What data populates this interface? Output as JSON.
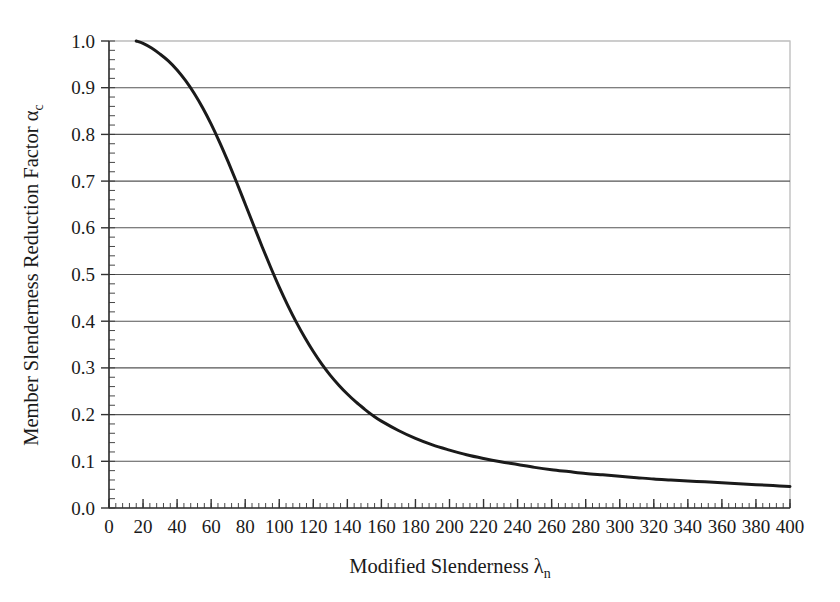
{
  "figure": {
    "background_color": "#ffffff",
    "plot_border_color": "#b4b4b4",
    "gridline_color": "#555555",
    "curve_color": "#1a1a1a",
    "axis_color": "#333333"
  },
  "axis_titles": {
    "x_main": "Modified Slenderness ",
    "x_symbol": "λ",
    "x_subscript": "n",
    "y_main": "Member Slenderness Reduction Factor ",
    "y_symbol": "α",
    "y_subscript": "c"
  },
  "chart_data": {
    "type": "line",
    "title": "",
    "subtitle": "",
    "xlabel": "Modified Slenderness λ_n",
    "ylabel": "Member Slenderness Reduction Factor α_c",
    "xlim": [
      0,
      400
    ],
    "ylim": [
      0.0,
      1.0
    ],
    "grid": true,
    "grid_axis": "y",
    "legend": "none",
    "xticks": [
      0,
      20,
      40,
      60,
      80,
      100,
      120,
      140,
      160,
      180,
      200,
      220,
      240,
      260,
      280,
      300,
      320,
      340,
      360,
      380,
      400
    ],
    "xtick_labels": [
      "0",
      "20",
      "40",
      "60",
      "80",
      "100",
      "120",
      "140",
      "160",
      "180",
      "200",
      "220",
      "240",
      "260",
      "280",
      "300",
      "320",
      "340",
      "360",
      "380",
      "400"
    ],
    "x_minor_tick_step": 4,
    "yticks": [
      0.0,
      0.1,
      0.2,
      0.3,
      0.4,
      0.5,
      0.6,
      0.7,
      0.8,
      0.9,
      1.0
    ],
    "ytick_labels": [
      "0.0",
      "0.1",
      "0.2",
      "0.3",
      "0.4",
      "0.5",
      "0.6",
      "0.7",
      "0.8",
      "0.9",
      "1.0"
    ],
    "y_minor_tick_step": 0.02,
    "series": [
      {
        "name": "Member slenderness reduction factor",
        "color": "#1a1a1a",
        "line_width": 3,
        "x": [
          16,
          20,
          25,
          30,
          35,
          40,
          45,
          50,
          55,
          60,
          65,
          70,
          75,
          80,
          85,
          90,
          95,
          100,
          105,
          110,
          115,
          120,
          125,
          130,
          135,
          140,
          145,
          150,
          155,
          160,
          170,
          180,
          190,
          200,
          210,
          220,
          230,
          240,
          250,
          260,
          270,
          280,
          290,
          300,
          310,
          320,
          330,
          340,
          350,
          360,
          370,
          380,
          390,
          400
        ],
        "y": [
          1.0,
          0.995,
          0.985,
          0.972,
          0.957,
          0.938,
          0.915,
          0.888,
          0.857,
          0.822,
          0.783,
          0.741,
          0.697,
          0.651,
          0.605,
          0.559,
          0.515,
          0.473,
          0.434,
          0.398,
          0.365,
          0.335,
          0.308,
          0.284,
          0.263,
          0.244,
          0.227,
          0.212,
          0.198,
          0.186,
          0.166,
          0.149,
          0.135,
          0.124,
          0.114,
          0.106,
          0.099,
          0.093,
          0.087,
          0.082,
          0.078,
          0.074,
          0.071,
          0.068,
          0.065,
          0.062,
          0.06,
          0.058,
          0.056,
          0.054,
          0.052,
          0.05,
          0.048,
          0.046
        ]
      }
    ],
    "notable_points": [
      {
        "x": 16,
        "y": 1.0,
        "note": "curve start"
      },
      {
        "x": 49,
        "y": 0.9
      },
      {
        "x": 71,
        "y": 0.73
      },
      {
        "x": 100,
        "y": 0.47
      },
      {
        "x": 115,
        "y": 0.365
      },
      {
        "x": 130,
        "y": 0.284
      },
      {
        "x": 155,
        "y": 0.2
      },
      {
        "x": 190,
        "y": 0.135
      },
      {
        "x": 270,
        "y": 0.078
      },
      {
        "x": 400,
        "y": 0.046
      }
    ]
  }
}
